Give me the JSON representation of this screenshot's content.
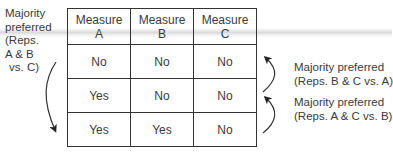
{
  "left_annotation": {
    "lines": [
      "Majority",
      "preferred",
      "(Reps.",
      "A & B",
      "vs. C)"
    ],
    "arrow_direction": "down"
  },
  "table": {
    "headers": [
      {
        "line1": "Measure",
        "line2": "A"
      },
      {
        "line1": "Measure",
        "line2": "B"
      },
      {
        "line1": "Measure",
        "line2": "C"
      }
    ],
    "rows": [
      [
        "No",
        "No",
        "No"
      ],
      [
        "Yes",
        "No",
        "No"
      ],
      [
        "Yes",
        "Yes",
        "No"
      ]
    ]
  },
  "right_annotations": [
    {
      "line1": "Majority preferred",
      "line2": "(Reps. B & C vs. A)",
      "arrow_direction": "up"
    },
    {
      "line1": "Majority preferred",
      "line2": "(Reps. A & C vs. B)",
      "arrow_direction": "up"
    }
  ]
}
